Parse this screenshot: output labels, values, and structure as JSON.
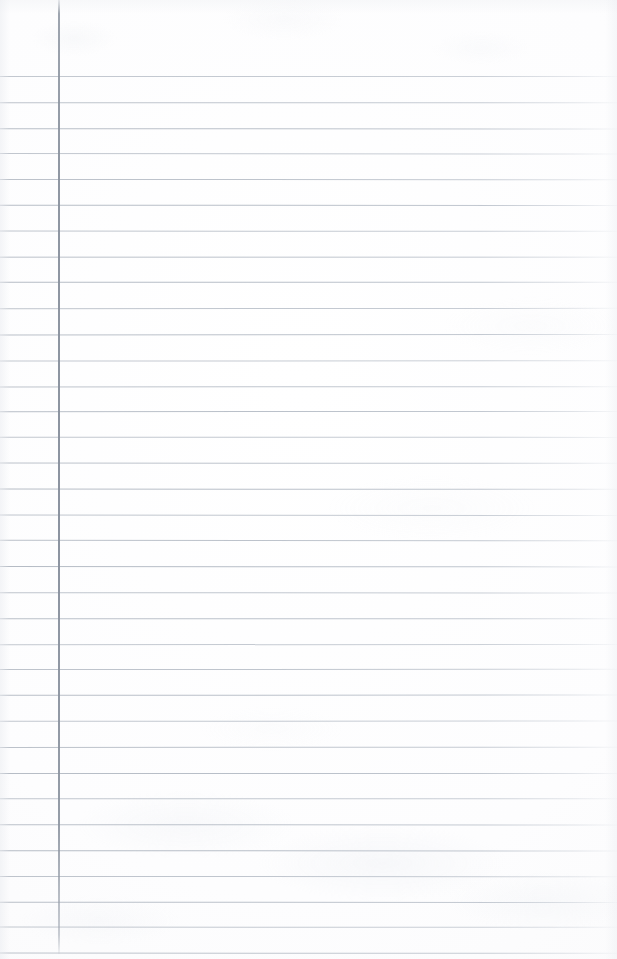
{
  "document": {
    "kind": "scanned-ruled-notebook-page",
    "title": "Blank ruled notebook page",
    "content_text": "",
    "page_width": 617,
    "page_height": 959,
    "paper_color": "#fdfdfe",
    "background_color": "#ffffff"
  },
  "ruling": {
    "line_color": "#b2b9c3",
    "line_thickness": 1,
    "first_line_y": 76,
    "line_spacing": 25.8,
    "line_count": 35,
    "line_start_x": 0,
    "line_end_x": 617,
    "right_fade": true,
    "lines_y": [
      76,
      101.8,
      127.6,
      153.4,
      179.2,
      205,
      230.8,
      256.6,
      282.4,
      308.2,
      334,
      359.8,
      385.6,
      411.4,
      437.2,
      463,
      488.8,
      514.6,
      540.4,
      566.2,
      592,
      617.8,
      643.6,
      669.4,
      695.2,
      721,
      746.8,
      772.6,
      798.4,
      824.2,
      850,
      875.8,
      901.6,
      927.4,
      953.2
    ]
  },
  "margin_rule": {
    "name": "vertical-margin-rule",
    "color": "#8a929e",
    "x": 58,
    "thickness": 2,
    "top_y": 0,
    "bottom_y": 954
  },
  "header_area": {
    "label": "blank-top-margin",
    "height": 76,
    "text": ""
  },
  "annotations": {
    "handwriting": "",
    "notes": "",
    "stamps": ""
  }
}
